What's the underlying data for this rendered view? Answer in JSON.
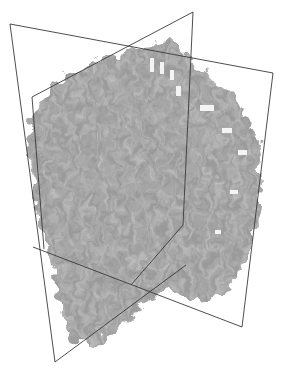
{
  "scene": {
    "type": "3D volume rendering with orthogonal slice planes",
    "background_color": "#ffffff",
    "volume_color": "#9a9a9a",
    "volume_dark_color": "#7a7a7a",
    "volume_light_color": "#bdbdbd",
    "frame_line_color": "#3a3a3a",
    "highlight_color": "#f4f4f4",
    "planes": [
      {
        "name": "oblique-plane",
        "corners": [
          [
            10,
            24
          ],
          [
            273,
            73
          ],
          [
            242,
            327
          ],
          [
            55,
            362
          ]
        ]
      },
      {
        "name": "front-plane",
        "corners": [
          [
            32,
            97
          ],
          [
            193,
            12
          ],
          [
            186,
            265
          ],
          [
            33,
            247
          ]
        ]
      }
    ],
    "caption": "volume-render"
  }
}
